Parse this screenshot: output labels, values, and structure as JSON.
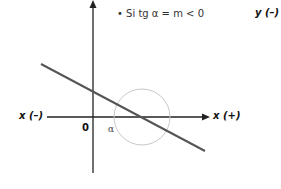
{
  "condition": {
    "bullet": "•",
    "text": "Si tg α = m < 0"
  },
  "labels": {
    "y_negative": "y (–)",
    "x_negative": "x (–)",
    "x_positive": "x (+)",
    "origin": "0",
    "angle": "α"
  },
  "colors": {
    "axis": "#222222",
    "line": "#555555",
    "circle": "#c8c8c8"
  }
}
